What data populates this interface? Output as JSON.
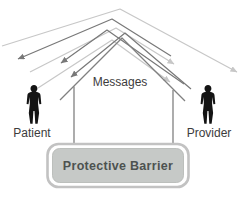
{
  "diagram": {
    "annotation": "Messages",
    "nodes": [
      {
        "id": "patient",
        "type": "person-silhouette",
        "label": "Patient"
      },
      {
        "id": "provider",
        "type": "person-silhouette",
        "label": "Provider"
      },
      {
        "id": "barrier",
        "type": "rounded-box",
        "label": "Protective Barrier"
      }
    ],
    "labels": {
      "messages": "Messages",
      "patient": "Patient",
      "provider": "Provider",
      "barrier": "Protective Barrier"
    },
    "semantics": "Message arrows are deflected over a roof-shaped protective barrier standing between the Patient and the Provider",
    "colors": {
      "background": "#ffffff",
      "line_light": "#c7c7c7",
      "line_dark": "#787878",
      "structure_line": "#808080",
      "barrier_fill": "#c6c9c7",
      "barrier_border": "#c2c2c2",
      "barrier_text": "#4d5250",
      "label_text": "#3c3c3c",
      "silhouette": "#141414"
    }
  }
}
